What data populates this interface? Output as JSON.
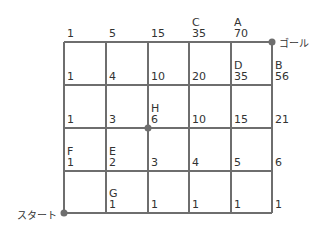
{
  "diagram": {
    "type": "grid-path-counting",
    "start_label": "スタート",
    "goal_label": "ゴール",
    "grid": {
      "cols": 5,
      "rows": 4
    },
    "colors": {
      "line": "#6e6e6e",
      "dot": "#6e6e6e",
      "text": "#333333"
    },
    "nodes": [
      {
        "row": 0,
        "col": 0,
        "letter": "",
        "value": "1"
      },
      {
        "row": 0,
        "col": 1,
        "letter": "",
        "value": "5"
      },
      {
        "row": 0,
        "col": 2,
        "letter": "",
        "value": "15"
      },
      {
        "row": 0,
        "col": 3,
        "letter": "C",
        "value": "35"
      },
      {
        "row": 0,
        "col": 4,
        "letter": "A",
        "value": "70"
      },
      {
        "row": 1,
        "col": 0,
        "letter": "",
        "value": "1"
      },
      {
        "row": 1,
        "col": 1,
        "letter": "",
        "value": "4"
      },
      {
        "row": 1,
        "col": 2,
        "letter": "",
        "value": "10"
      },
      {
        "row": 1,
        "col": 3,
        "letter": "",
        "value": "20"
      },
      {
        "row": 1,
        "col": 4,
        "letter": "D",
        "value": "35"
      },
      {
        "row": 1,
        "col": 5,
        "letter": "B",
        "value": "56"
      },
      {
        "row": 2,
        "col": 0,
        "letter": "",
        "value": "1"
      },
      {
        "row": 2,
        "col": 1,
        "letter": "",
        "value": "3"
      },
      {
        "row": 2,
        "col": 2,
        "letter": "H",
        "value": "6"
      },
      {
        "row": 2,
        "col": 3,
        "letter": "",
        "value": "10"
      },
      {
        "row": 2,
        "col": 4,
        "letter": "",
        "value": "15"
      },
      {
        "row": 2,
        "col": 5,
        "letter": "",
        "value": "21"
      },
      {
        "row": 3,
        "col": 0,
        "letter": "F",
        "value": "1"
      },
      {
        "row": 3,
        "col": 1,
        "letter": "E",
        "value": "2"
      },
      {
        "row": 3,
        "col": 2,
        "letter": "",
        "value": "3"
      },
      {
        "row": 3,
        "col": 3,
        "letter": "",
        "value": "4"
      },
      {
        "row": 3,
        "col": 4,
        "letter": "",
        "value": "5"
      },
      {
        "row": 3,
        "col": 5,
        "letter": "",
        "value": "6"
      },
      {
        "row": 4,
        "col": 1,
        "letter": "G",
        "value": "1"
      },
      {
        "row": 4,
        "col": 2,
        "letter": "",
        "value": "1"
      },
      {
        "row": 4,
        "col": 3,
        "letter": "",
        "value": "1"
      },
      {
        "row": 4,
        "col": 4,
        "letter": "",
        "value": "1"
      },
      {
        "row": 4,
        "col": 5,
        "letter": "",
        "value": "1"
      }
    ]
  }
}
